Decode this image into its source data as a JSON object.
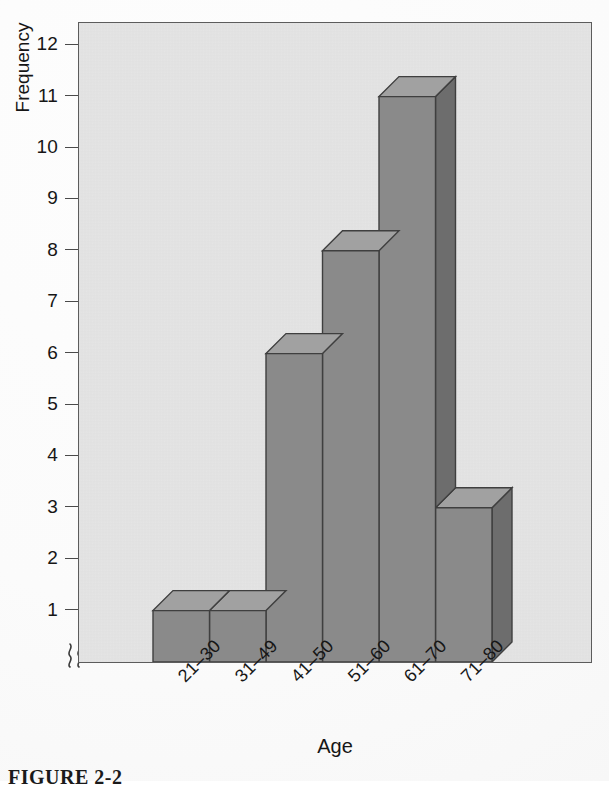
{
  "figure": {
    "caption": "FIGURE 2-2",
    "background_color": "#ffffff"
  },
  "chart_data": {
    "type": "bar",
    "title": "",
    "subtitle": "",
    "xlabel": "Age",
    "ylabel": "Frequency",
    "categories": [
      "21–30",
      "31–49",
      "41–50",
      "51–60",
      "61–70",
      "71–80"
    ],
    "values": [
      1,
      1,
      6,
      8,
      11,
      3
    ],
    "ylim": [
      0,
      12
    ],
    "y_ticks": [
      12,
      11,
      10,
      9,
      8,
      7,
      6,
      5,
      4,
      3,
      2,
      1
    ],
    "y_tick_labels": [
      "12",
      "11",
      "10",
      "9",
      "8",
      "7",
      "6",
      "5",
      "4",
      "3",
      "2",
      "1"
    ],
    "grid": false,
    "legend": null,
    "legend_position": "none",
    "axis_break": true,
    "axis_break_symbol": "⟩⟩",
    "style": "3d-isometric-grayscale",
    "bar_style_note": "extruded 3D bars: front face, lighter top face, darker right face",
    "annotations": []
  },
  "style": {
    "plot_background": "#e5e5e5",
    "frame_color": "#5c5c5c",
    "bar_front_color": "#8a8a8a",
    "bar_top_color": "#a1a1a1",
    "bar_side_color": "#6d6d6d",
    "bar_edge_color": "#3f3f3f",
    "text_color": "#161616",
    "tick_color": "#4a4a4a"
  },
  "geometry": {
    "plot_left": 78,
    "plot_top": 22,
    "plot_width": 514,
    "plot_height": 641,
    "baseline_y": 639,
    "unit_px": 51.4,
    "bar_start_x": 74,
    "bar_width": 56.5,
    "depth_x": 20,
    "depth_y": 20
  }
}
